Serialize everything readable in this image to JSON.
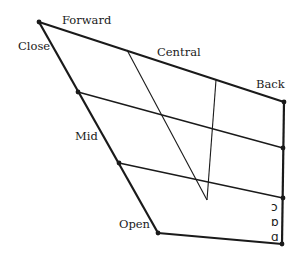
{
  "diagram": {
    "type": "IPA vowel quadrilateral",
    "labels": {
      "close": "Close",
      "forward": "Forward",
      "central": "Central",
      "back": "Back",
      "mid": "Mid",
      "open": "Open"
    },
    "vowel_symbols": [
      {
        "symbol": "ɔ",
        "description": "open-mid back rounded"
      },
      {
        "symbol": "ɒ",
        "description": "open back rounded"
      },
      {
        "symbol": "ɑ",
        "description": "open back unrounded"
      }
    ],
    "colors": {
      "line": "#1a1a1a",
      "background": "#ffffff"
    }
  }
}
